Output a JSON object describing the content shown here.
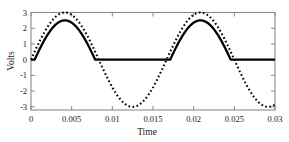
{
  "chart_data": {
    "type": "line",
    "title": "",
    "subtitle": "",
    "xlabel": "Time",
    "ylabel": "Volts",
    "xlim": [
      0,
      0.03
    ],
    "ylim": [
      -3.2,
      3.0
    ],
    "xticks": [
      0,
      0.005,
      0.01,
      0.015,
      0.02,
      0.025,
      0.03
    ],
    "xticklabels": [
      "0",
      "0.005",
      "0.01",
      "0.015",
      "0.02",
      "0.025",
      "0.03"
    ],
    "yticks": [
      -3,
      -2,
      -1,
      0,
      1,
      2,
      3
    ],
    "yticklabels": [
      "-3",
      "-2",
      "-1",
      "0",
      "1",
      "2",
      "3"
    ],
    "grid": false,
    "legend": null,
    "annotations": [],
    "series": [
      {
        "name": "input sine",
        "style": "dotted",
        "color": "#000000",
        "linewidth": 2.0,
        "amplitude": 3.0,
        "frequency_hz": 60,
        "period_s": 0.016667,
        "x": [
          0,
          0.001,
          0.002,
          0.003,
          0.004167,
          0.005,
          0.006,
          0.007,
          0.008333,
          0.009,
          0.01,
          0.011,
          0.0125,
          0.013,
          0.014,
          0.015,
          0.016667,
          0.018,
          0.019,
          0.020833,
          0.022,
          0.023,
          0.025,
          0.026,
          0.027,
          0.029167,
          0.03
        ],
        "values": [
          0,
          1.04,
          1.94,
          2.6,
          3.0,
          2.93,
          2.49,
          1.76,
          0,
          -0.53,
          -1.46,
          -2.25,
          -3.0,
          -2.95,
          -2.53,
          -1.82,
          0,
          1.38,
          2.16,
          3.0,
          2.71,
          2.13,
          0.26,
          -0.53,
          -1.46,
          -3.0,
          -2.95
        ]
      },
      {
        "name": "half-wave rectified output",
        "style": "solid",
        "color": "#000000",
        "linewidth": 2.4,
        "amplitude": 2.5,
        "diode_drop": 0.5,
        "x": [
          0,
          0.001,
          0.002,
          0.003,
          0.004167,
          0.005,
          0.006,
          0.007,
          0.0078,
          0.008333,
          0.012,
          0.016667,
          0.0175,
          0.018,
          0.019,
          0.020833,
          0.022,
          0.023,
          0.0243,
          0.025,
          0.028,
          0.03
        ],
        "values": [
          0,
          0.54,
          1.44,
          2.1,
          2.5,
          2.43,
          1.99,
          1.26,
          0,
          0,
          0,
          0,
          0,
          0.88,
          1.66,
          2.5,
          2.21,
          1.63,
          0,
          0,
          0,
          0
        ]
      }
    ]
  },
  "axis": {
    "ylabel_text": "Volts",
    "xlabel_text": "Time"
  }
}
